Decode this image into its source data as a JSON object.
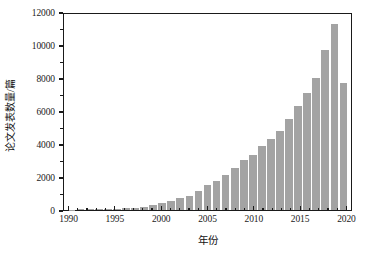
{
  "chart_data": {
    "type": "bar",
    "title": "",
    "xlabel": "年份",
    "ylabel": "论文发表数量/篇",
    "xlim": [
      1989.4,
      2020.6
    ],
    "ylim": [
      0,
      12000
    ],
    "grid": false,
    "legend": null,
    "bar_color": "#a3a3a3",
    "axis_color": "#1a1a1a",
    "background": "#ffffff",
    "y_ticks": [
      0,
      2000,
      4000,
      6000,
      8000,
      10000,
      12000
    ],
    "y_tick_labels": [
      "0",
      "2000",
      "4000",
      "6000",
      "8000",
      "10000",
      "12000"
    ],
    "y_minor_ticks": [
      1000,
      3000,
      5000,
      7000,
      9000,
      11000
    ],
    "x_ticks": [
      1990,
      1995,
      2000,
      2005,
      2010,
      2015,
      2020
    ],
    "x_tick_labels": [
      "1990",
      "1995",
      "2000",
      "2005",
      "2010",
      "2015",
      "2020"
    ],
    "x_minor_ticks": [
      1991,
      1992,
      1993,
      1994,
      1996,
      1997,
      1998,
      1999,
      2001,
      2002,
      2003,
      2004,
      2006,
      2007,
      2008,
      2009,
      2011,
      2012,
      2013,
      2014,
      2016,
      2017,
      2018,
      2019
    ],
    "categories": [
      1990,
      1991,
      1992,
      1993,
      1994,
      1995,
      1996,
      1997,
      1998,
      1999,
      2000,
      2001,
      2002,
      2003,
      2004,
      2005,
      2006,
      2007,
      2008,
      2009,
      2010,
      2011,
      2012,
      2013,
      2014,
      2015,
      2016,
      2017,
      2018,
      2019,
      2020
    ],
    "values": [
      20,
      35,
      45,
      55,
      60,
      75,
      110,
      140,
      200,
      310,
      420,
      560,
      740,
      870,
      1150,
      1500,
      1750,
      2100,
      2550,
      3050,
      3350,
      3880,
      4280,
      4800,
      5500,
      6330,
      7080,
      8000,
      9680,
      11250,
      7700
    ]
  }
}
